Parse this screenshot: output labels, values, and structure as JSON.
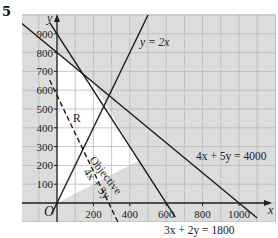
{
  "question_number": "5",
  "chart_data": {
    "type": "line",
    "title": "",
    "xlabel": "x",
    "ylabel": "y",
    "origin_label": "O",
    "xlim": [
      -60,
      1160
    ],
    "ylim": [
      -100,
      1000
    ],
    "grid": true,
    "x_ticks": [
      200,
      400,
      600,
      800,
      1000
    ],
    "y_ticks": [
      100,
      200,
      300,
      400,
      500,
      600,
      700,
      800,
      900
    ],
    "series": [
      {
        "name": "y = 2x",
        "style": "solid",
        "points": [
          [
            -30,
            -60
          ],
          [
            500,
            1000
          ]
        ]
      },
      {
        "name": "4x + 5y = 4000",
        "style": "solid",
        "points": [
          [
            -200,
            960
          ],
          [
            1100,
            -80
          ]
        ]
      },
      {
        "name": "3x + 2y = 1800",
        "style": "solid",
        "points": [
          [
            -40,
            960
          ],
          [
            650,
            -75
          ]
        ]
      },
      {
        "name": "Objective 4x + 3y",
        "style": "dashed",
        "points": [
          [
            -40,
            653
          ],
          [
            350,
            -133
          ]
        ]
      }
    ],
    "region_label": "R",
    "feasible_region_vertices": [
      [
        0,
        0
      ],
      [
        0,
        800
      ],
      [
        200,
        640
      ],
      [
        450,
        225
      ],
      [
        0,
        0
      ]
    ],
    "annotations": [
      {
        "text": "y = 2x"
      },
      {
        "text": "4x + 5y = 4000"
      },
      {
        "text": "3x + 2y = 1800"
      },
      {
        "text": "Objective"
      },
      {
        "text": "4x + 3y"
      },
      {
        "text": "R"
      }
    ]
  },
  "labels": {
    "y_eq_2x": "y = 2x",
    "line_4x5y": "4x + 5y = 4000",
    "line_3x2y": "3x + 2y = 1800",
    "objective_title": "Objective",
    "objective_expr": "4x + 3y",
    "region": "R",
    "x_axis": "x",
    "y_axis": "y",
    "origin": "O",
    "x_tick_labels": [
      "200",
      "400",
      "600",
      "800",
      "1000"
    ],
    "y_tick_labels": [
      "100",
      "200",
      "300",
      "400",
      "500",
      "600",
      "700",
      "800",
      "900"
    ]
  }
}
